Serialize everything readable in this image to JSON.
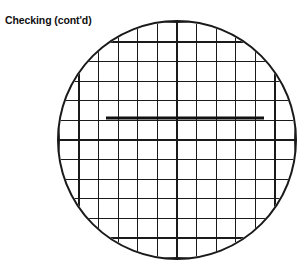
{
  "figure": {
    "caption": "Checking (cont'd)",
    "background_color": "#ffffff",
    "ink_color": "#1a1a1a"
  },
  "reticle": {
    "name": "circular-field-of-view",
    "center_x": 177,
    "center_y": 140,
    "radius": 119,
    "outline_color": "#1a1a1a",
    "outline_width": 2.0
  },
  "grid": {
    "name": "square-grid-graticule",
    "cell_size": 19.6,
    "line_color": "#1a1a1a",
    "line_width": 1.3,
    "origin_x": 177,
    "origin_y": 140,
    "vertical_line_count": 13,
    "horizontal_line_count": 13,
    "vertical_offsets": [
      -117.6,
      -98.0,
      -78.4,
      -58.8,
      -39.2,
      -19.6,
      0,
      19.6,
      39.2,
      58.8,
      78.4,
      98.0,
      117.6
    ],
    "horizontal_offsets": [
      -117.6,
      -98.0,
      -78.4,
      -58.8,
      -39.2,
      -19.6,
      0,
      19.6,
      39.2,
      58.8,
      78.4,
      98.0,
      117.6
    ]
  },
  "measurement_line": {
    "name": "bold-measurement-line",
    "x_start": 106,
    "x_end": 264,
    "y": 118,
    "color": "#111111",
    "width": 3.2,
    "length_cells": 8
  }
}
